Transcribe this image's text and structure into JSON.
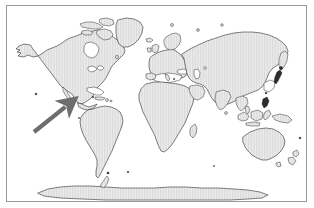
{
  "figure": {
    "type": "world-map",
    "projection": "equirectangular",
    "width": 314,
    "height": 208,
    "background_color": "#ffffff",
    "border_color": "#9a9a9a",
    "border_rect": {
      "x": 6,
      "y": 5,
      "width": 301,
      "height": 197
    },
    "caption": "",
    "title": ""
  },
  "style": {
    "land_fill": "#e8e8e8",
    "land_hatch_color": "#bdbdbd",
    "coastline_color": "#1a1a1a",
    "ocean_color": "#ffffff",
    "arrow_color": "#6e6e6e"
  },
  "annotations": [
    {
      "name": "location-pointer-arrow",
      "kind": "arrow",
      "color": "#6e6e6e",
      "label": "",
      "points_to": "northwestern South America / Panama isthmus",
      "tail": {
        "x": 34,
        "y": 132
      },
      "tip": {
        "x": 70,
        "y": 103
      }
    }
  ],
  "continents": [
    {
      "id": "north-america",
      "label": "North America"
    },
    {
      "id": "south-america",
      "label": "South America"
    },
    {
      "id": "greenland",
      "label": "Greenland"
    },
    {
      "id": "europe",
      "label": "Europe"
    },
    {
      "id": "africa",
      "label": "Africa"
    },
    {
      "id": "asia",
      "label": "Asia"
    },
    {
      "id": "australia",
      "label": "Australia"
    },
    {
      "id": "antarctica",
      "label": "Antarctica"
    },
    {
      "id": "indonesia",
      "label": "Indonesian Archipelago"
    },
    {
      "id": "japan",
      "label": "Japan"
    },
    {
      "id": "new-zealand",
      "label": "New Zealand"
    },
    {
      "id": "madagascar",
      "label": "Madagascar"
    },
    {
      "id": "british-isles",
      "label": "British Isles"
    },
    {
      "id": "iceland",
      "label": "Iceland"
    },
    {
      "id": "canadian-arctic",
      "label": "Canadian Arctic Archipelago"
    }
  ]
}
